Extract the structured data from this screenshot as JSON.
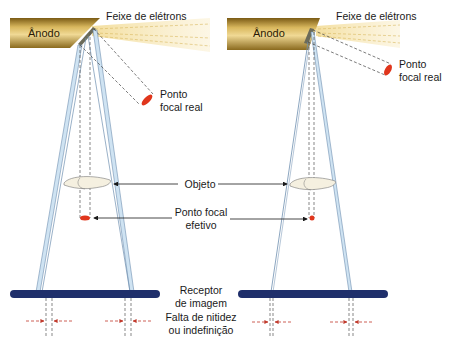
{
  "colors": {
    "anode_dark": "#8a6a1e",
    "anode_light": "#e9cf86",
    "beam_fill": "#cfe3f2",
    "beam_edge": "#6f8fb0",
    "electron_beam": "#f6e7b4",
    "focal_spot": "#e0361c",
    "receptor": "#1f2f6b",
    "dash": "#555555",
    "arrow_red": "#c0392b"
  },
  "labels": {
    "anode_left": "Ânodo",
    "anode_right": "Ânodo",
    "electron_beam_left": "Feixe de elétrons",
    "electron_beam_right": "Feixe de elétrons",
    "real_focal_left_line1": "Ponto",
    "real_focal_left_line2": "focal real",
    "real_focal_right_line1": "Ponto",
    "real_focal_right_line2": "focal real",
    "object": "Objeto",
    "effective_focal_line1": "Ponto focal",
    "effective_focal_line2": "efetivo",
    "receptor_line1": "Receptor",
    "receptor_line2": "de imagem",
    "unsharpness_line1": "Falta de nitidez",
    "unsharpness_line2": "ou indefinição"
  },
  "panels": [
    {
      "name": "large-focal-spot",
      "focal_spot": "large",
      "penumbra": "wide"
    },
    {
      "name": "small-focal-spot",
      "focal_spot": "small",
      "penumbra": "narrow"
    }
  ]
}
